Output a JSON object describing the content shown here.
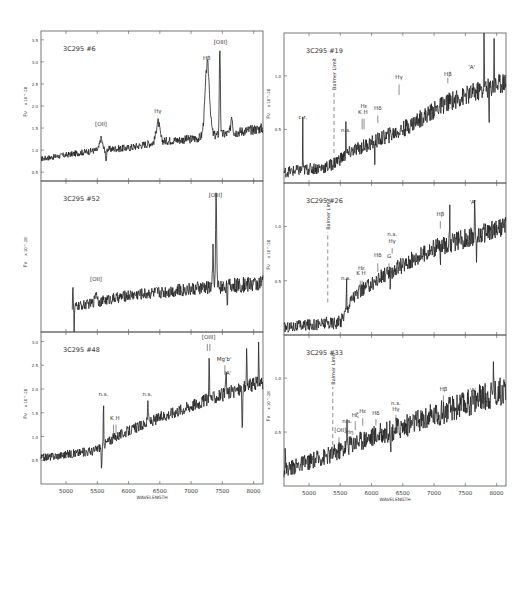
{
  "figure": {
    "xlabel": "WAVELENGTH",
    "ylabel": "Fν",
    "yunit": "x 10^-28"
  },
  "chart_data": [
    {
      "type": "line",
      "title": "3C295 #6",
      "column": "left",
      "row": 0,
      "xlim": [
        4600,
        8150
      ],
      "ylim": [
        0.3,
        3.7
      ],
      "xticks": [
        5000,
        5500,
        6000,
        6500,
        7000,
        7500,
        8000
      ],
      "yticks": [
        0.5,
        1.0,
        1.5,
        2.0,
        2.5,
        3.0,
        3.5
      ],
      "show_xtick_labels": false,
      "show_ylabel": true,
      "baseline": [
        [
          4600,
          0.8
        ],
        [
          5500,
          1.0
        ],
        [
          6000,
          1.05
        ],
        [
          6500,
          1.2
        ],
        [
          7000,
          1.25
        ],
        [
          8150,
          1.5
        ]
      ],
      "noise": 0.06,
      "features": [
        {
          "x": 5560,
          "amp": 0.25,
          "w": 30
        },
        {
          "x": 5640,
          "amp": -0.35,
          "w": 8
        },
        {
          "x": 6470,
          "amp": 0.45,
          "w": 40
        },
        {
          "x": 7260,
          "amp": 1.65,
          "w": 50
        },
        {
          "x": 7460,
          "amp": 2.0,
          "w": 12
        },
        {
          "x": 7650,
          "amp": 0.4,
          "w": 20
        }
      ],
      "annotations": [
        {
          "text": "[OII]",
          "x": 5560,
          "y": 1.55
        },
        {
          "text": "Hγ",
          "x": 6470,
          "y": 1.85
        },
        {
          "text": "Hβ",
          "x": 7250,
          "y": 3.05
        },
        {
          "text": "[OIII]",
          "x": 7470,
          "y": 3.4
        }
      ],
      "markers": []
    },
    {
      "type": "line",
      "title": "3C295 #52",
      "column": "left",
      "row": 1,
      "xlim": [
        4600,
        8150
      ],
      "ylim": [
        0.0,
        3.7
      ],
      "xticks": [
        5000,
        5500,
        6000,
        6500,
        7000,
        7500,
        8000
      ],
      "yticks": [],
      "show_xtick_labels": false,
      "show_ylabel": true,
      "start_x": 5100,
      "baseline": [
        [
          5100,
          0.6
        ],
        [
          6000,
          0.9
        ],
        [
          7000,
          1.05
        ],
        [
          8150,
          1.2
        ]
      ],
      "noise": 0.1,
      "features": [
        {
          "x": 5110,
          "amp": 0.6,
          "w": 6
        },
        {
          "x": 5130,
          "amp": -0.6,
          "w": 6
        },
        {
          "x": 5480,
          "amp": 0.25,
          "w": 25
        },
        {
          "x": 7350,
          "amp": 0.9,
          "w": 10
        },
        {
          "x": 7400,
          "amp": 2.3,
          "w": 12
        },
        {
          "x": 7580,
          "amp": -0.35,
          "w": 8
        }
      ],
      "annotations": [
        {
          "text": "[OII]",
          "x": 5480,
          "y": 1.25
        },
        {
          "text": "[OIII]",
          "x": 7390,
          "y": 3.3
        }
      ],
      "markers": []
    },
    {
      "type": "line",
      "title": "3C295 #48",
      "column": "left",
      "row": 2,
      "xlim": [
        4600,
        8150
      ],
      "ylim": [
        0.0,
        3.2
      ],
      "xticks": [
        5000,
        5500,
        6000,
        6500,
        7000,
        7500,
        8000
      ],
      "xtick_labels": [
        "5000",
        "5500",
        "6000",
        "6500",
        "7000",
        "7500",
        "8000"
      ],
      "yticks": [
        0.5,
        1.0,
        1.5,
        2.0,
        2.5,
        3.0
      ],
      "show_xtick_labels": true,
      "show_ylabel": true,
      "baseline": [
        [
          4600,
          0.55
        ],
        [
          5450,
          0.7
        ],
        [
          5800,
          1.0
        ],
        [
          6500,
          1.4
        ],
        [
          7200,
          1.75
        ],
        [
          8150,
          2.15
        ]
      ],
      "noise": 0.08,
      "features": [
        {
          "x": 5570,
          "amp": -0.45,
          "w": 10
        },
        {
          "x": 5600,
          "amp": 0.9,
          "w": 6
        },
        {
          "x": 6310,
          "amp": 0.5,
          "w": 8
        },
        {
          "x": 7290,
          "amp": 0.9,
          "w": 8
        },
        {
          "x": 7560,
          "amp": 0.5,
          "w": 8
        },
        {
          "x": 7820,
          "amp": -0.9,
          "w": 8
        },
        {
          "x": 7890,
          "amp": 0.8,
          "w": 8
        },
        {
          "x": 8080,
          "amp": 0.9,
          "w": 6
        }
      ],
      "annotations": [
        {
          "text": "n.s.",
          "x": 5600,
          "y": 1.85
        },
        {
          "text": "K H",
          "x": 5780,
          "y": 1.35
        },
        {
          "text": "n.s.",
          "x": 6300,
          "y": 1.85
        },
        {
          "text": "[OIII]",
          "x": 7280,
          "y": 3.05
        },
        {
          "text": "Mg'b'",
          "x": 7530,
          "y": 2.6
        },
        {
          "text": "'A'",
          "x": 7590,
          "y": 2.3
        }
      ],
      "markers": [
        {
          "x": 5760,
          "y0": 1.05,
          "y1": 1.25
        },
        {
          "x": 5800,
          "y0": 1.05,
          "y1": 1.25
        },
        {
          "x": 7260,
          "y0": 2.8,
          "y1": 2.95
        },
        {
          "x": 7300,
          "y0": 2.8,
          "y1": 2.95
        },
        {
          "x": 7540,
          "y0": 2.3,
          "y1": 2.5
        }
      ]
    },
    {
      "type": "line",
      "title": "3C295 #19",
      "column": "right",
      "row": 0,
      "xlim": [
        4600,
        8150
      ],
      "ylim": [
        0.0,
        1.4
      ],
      "xticks": [
        5000,
        5500,
        6000,
        6500,
        7000,
        7500,
        8000
      ],
      "yticks": [
        0.5,
        1.0
      ],
      "show_xtick_labels": false,
      "show_ylabel": true,
      "baseline": [
        [
          4600,
          0.1
        ],
        [
          5300,
          0.15
        ],
        [
          5700,
          0.3
        ],
        [
          6500,
          0.5
        ],
        [
          7200,
          0.75
        ],
        [
          8150,
          0.95
        ]
      ],
      "noise": 0.05,
      "features": [
        {
          "x": 4900,
          "amp": 0.5,
          "w": 4
        },
        {
          "x": 5590,
          "amp": 0.3,
          "w": 5
        },
        {
          "x": 6050,
          "amp": -0.2,
          "w": 5
        },
        {
          "x": 7800,
          "amp": 0.55,
          "w": 5
        },
        {
          "x": 7880,
          "amp": -0.4,
          "w": 5
        },
        {
          "x": 7960,
          "amp": 0.4,
          "w": 5
        }
      ],
      "annotations": [
        {
          "text": "c.r.",
          "x": 4900,
          "y": 0.6
        },
        {
          "text": "n.s.",
          "x": 5590,
          "y": 0.48
        },
        {
          "text": "Hε",
          "x": 5880,
          "y": 0.7
        },
        {
          "text": "K H",
          "x": 5860,
          "y": 0.64
        },
        {
          "text": "Hδ",
          "x": 6100,
          "y": 0.68
        },
        {
          "text": "Hγ",
          "x": 6440,
          "y": 0.97
        },
        {
          "text": "Hβ",
          "x": 7220,
          "y": 1.0
        },
        {
          "text": "'A'",
          "x": 7600,
          "y": 1.06
        }
      ],
      "balmer_limit": {
        "x": 5400,
        "y0": 0.28,
        "y1": 0.85,
        "label": "Balmer Limit"
      },
      "markers": [
        {
          "x": 5850,
          "y0": 0.5,
          "y1": 0.6
        },
        {
          "x": 5880,
          "y0": 0.5,
          "y1": 0.6
        },
        {
          "x": 6100,
          "y0": 0.56,
          "y1": 0.63
        },
        {
          "x": 6440,
          "y0": 0.82,
          "y1": 0.92
        },
        {
          "x": 7220,
          "y0": 0.93,
          "y1": 0.98
        }
      ]
    },
    {
      "type": "line",
      "title": "3C295 #26",
      "column": "right",
      "row": 1,
      "xlim": [
        4600,
        8150
      ],
      "ylim": [
        0.0,
        1.4
      ],
      "xticks": [
        5000,
        5500,
        6000,
        6500,
        7000,
        7500,
        8000
      ],
      "yticks": [
        0.5,
        1.0
      ],
      "show_xtick_labels": false,
      "show_ylabel": true,
      "baseline": [
        [
          4600,
          0.07
        ],
        [
          5500,
          0.12
        ],
        [
          5700,
          0.35
        ],
        [
          6200,
          0.55
        ],
        [
          7000,
          0.8
        ],
        [
          8150,
          1.0
        ]
      ],
      "noise": 0.05,
      "features": [
        {
          "x": 5600,
          "amp": 0.3,
          "w": 5
        },
        {
          "x": 6300,
          "amp": -0.25,
          "w": 5
        },
        {
          "x": 7100,
          "amp": -0.2,
          "w": 5
        },
        {
          "x": 7250,
          "amp": 0.35,
          "w": 5
        },
        {
          "x": 7650,
          "amp": 0.3,
          "w": 5
        },
        {
          "x": 7680,
          "amp": -0.3,
          "w": 5
        }
      ],
      "annotations": [
        {
          "text": "n.s.",
          "x": 5590,
          "y": 0.51
        },
        {
          "text": "Hε",
          "x": 5840,
          "y": 0.6
        },
        {
          "text": "K H",
          "x": 5830,
          "y": 0.55
        },
        {
          "text": "Hδ",
          "x": 6100,
          "y": 0.72
        },
        {
          "text": "n.s.",
          "x": 6330,
          "y": 0.91
        },
        {
          "text": "Hγ",
          "x": 6330,
          "y": 0.85
        },
        {
          "text": "G",
          "x": 6280,
          "y": 0.71
        },
        {
          "text": "Hβ",
          "x": 7100,
          "y": 1.1
        },
        {
          "text": "'A'",
          "x": 7620,
          "y": 1.21
        }
      ],
      "balmer_limit": {
        "x": 5300,
        "y0": 0.3,
        "y1": 0.95,
        "label": "Balmer Limit"
      },
      "markers": [
        {
          "x": 5820,
          "y0": 0.42,
          "y1": 0.5
        },
        {
          "x": 5850,
          "y0": 0.42,
          "y1": 0.5
        },
        {
          "x": 6100,
          "y0": 0.58,
          "y1": 0.66
        },
        {
          "x": 6330,
          "y0": 0.75,
          "y1": 0.8
        },
        {
          "x": 6280,
          "y0": 0.6,
          "y1": 0.66
        },
        {
          "x": 7100,
          "y0": 0.98,
          "y1": 1.05
        }
      ]
    },
    {
      "type": "line",
      "title": "3C295 #33",
      "column": "right",
      "row": 2,
      "xlim": [
        4600,
        8150
      ],
      "ylim": [
        0.0,
        1.4
      ],
      "xticks": [
        5000,
        5500,
        6000,
        6500,
        7000,
        7500,
        8000
      ],
      "xtick_labels": [
        "5000",
        "5500",
        "6000",
        "6500",
        "7000",
        "7500",
        "8000"
      ],
      "yticks": [
        0.5,
        1.0
      ],
      "show_xtick_labels": true,
      "show_ylabel": true,
      "baseline": [
        [
          4600,
          0.15
        ],
        [
          5400,
          0.3
        ],
        [
          5700,
          0.4
        ],
        [
          6500,
          0.55
        ],
        [
          7200,
          0.7
        ],
        [
          8150,
          0.9
        ]
      ],
      "noise": 0.07,
      "features": [
        {
          "x": 4620,
          "amp": 0.3,
          "w": 4
        },
        {
          "x": 5610,
          "amp": 0.22,
          "w": 5
        },
        {
          "x": 6310,
          "amp": -0.3,
          "w": 5
        },
        {
          "x": 7950,
          "amp": 0.45,
          "w": 5
        }
      ],
      "annotations": [
        {
          "text": "[OII]",
          "x": 5500,
          "y": 0.5
        },
        {
          "text": "n.s.",
          "x": 5610,
          "y": 0.58
        },
        {
          "text": "Hη",
          "x": 5650,
          "y": 0.48
        },
        {
          "text": "Hζ",
          "x": 5740,
          "y": 0.64
        },
        {
          "text": "Hε",
          "x": 5860,
          "y": 0.68
        },
        {
          "text": "Hδ",
          "x": 6070,
          "y": 0.66
        },
        {
          "text": "n.s.",
          "x": 6390,
          "y": 0.75
        },
        {
          "text": "Hγ",
          "x": 6390,
          "y": 0.7
        },
        {
          "text": "Hβ",
          "x": 7150,
          "y": 0.88
        },
        {
          "text": "'A'",
          "x": 7620,
          "y": 0.87
        }
      ],
      "balmer_limit": {
        "x": 5380,
        "y0": 0.25,
        "y1": 0.92,
        "label": "Balmer Limit"
      },
      "markers": [
        {
          "x": 5480,
          "y0": 0.38,
          "y1": 0.45
        },
        {
          "x": 5650,
          "y0": 0.38,
          "y1": 0.45
        },
        {
          "x": 5740,
          "y0": 0.52,
          "y1": 0.6
        },
        {
          "x": 5860,
          "y0": 0.56,
          "y1": 0.63
        },
        {
          "x": 6070,
          "y0": 0.56,
          "y1": 0.62
        },
        {
          "x": 6390,
          "y0": 0.6,
          "y1": 0.66
        },
        {
          "x": 7150,
          "y0": 0.78,
          "y1": 0.84
        }
      ]
    }
  ]
}
